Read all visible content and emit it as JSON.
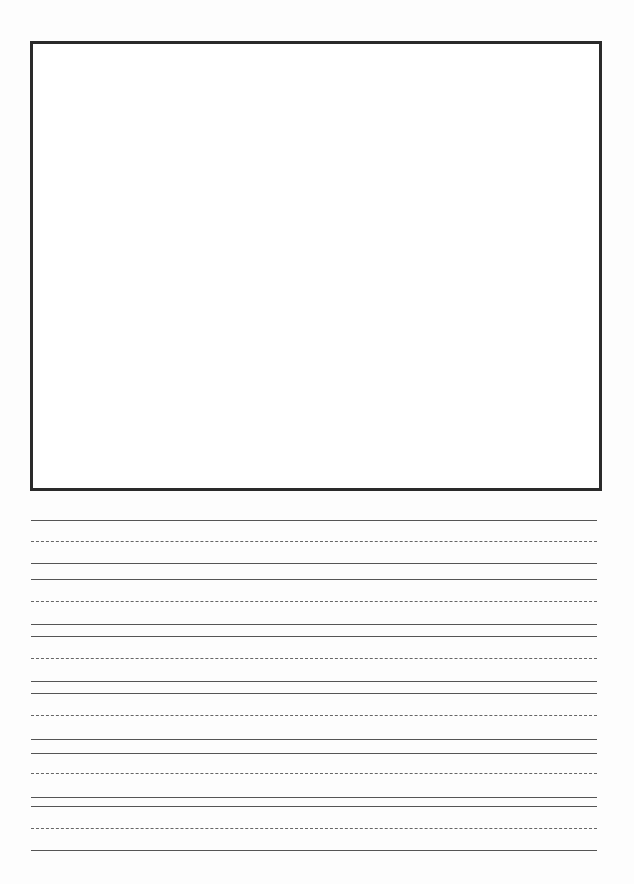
{
  "page": {
    "type": "primary handwriting paper",
    "drawing_box": {
      "present": true
    },
    "writing_lines": [
      {
        "y": 520,
        "style": "solid"
      },
      {
        "y": 541,
        "style": "dashed"
      },
      {
        "y": 563,
        "style": "solid"
      },
      {
        "y": 579,
        "style": "solid"
      },
      {
        "y": 601,
        "style": "dashed"
      },
      {
        "y": 624,
        "style": "solid"
      },
      {
        "y": 636,
        "style": "solid"
      },
      {
        "y": 658,
        "style": "dashed"
      },
      {
        "y": 681,
        "style": "solid"
      },
      {
        "y": 693,
        "style": "solid"
      },
      {
        "y": 715,
        "style": "dashed"
      },
      {
        "y": 739,
        "style": "solid"
      },
      {
        "y": 753,
        "style": "solid"
      },
      {
        "y": 773,
        "style": "dashed"
      },
      {
        "y": 797,
        "style": "solid"
      },
      {
        "y": 806,
        "style": "solid"
      },
      {
        "y": 828,
        "style": "dashed"
      },
      {
        "y": 850,
        "style": "solid"
      }
    ]
  }
}
